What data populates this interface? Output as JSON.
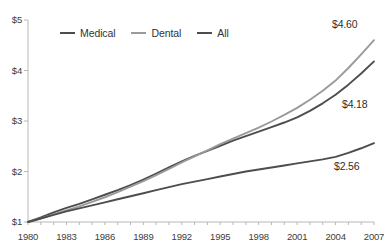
{
  "chart_data": {
    "type": "line",
    "title": "",
    "xlabel": "",
    "ylabel": "",
    "xlim": [
      1980,
      2007
    ],
    "ylim": [
      1,
      5
    ],
    "grid": false,
    "legend_position": "top-left-inside",
    "x_ticks": [
      "1980",
      "1983",
      "1986",
      "1989",
      "1992",
      "1995",
      "1998",
      "2001",
      "2004",
      "2007"
    ],
    "y_ticks": [
      "$1",
      "$2",
      "$3",
      "$4",
      "$5"
    ],
    "x": [
      1980,
      1981,
      1982,
      1983,
      1984,
      1985,
      1986,
      1987,
      1988,
      1989,
      1990,
      1991,
      1992,
      1993,
      1994,
      1995,
      1996,
      1997,
      1998,
      1999,
      2000,
      2001,
      2002,
      2003,
      2004,
      2005,
      2006,
      2007
    ],
    "series": [
      {
        "name": "Medical",
        "color": "#4d4d4d",
        "end_label": "$4.18",
        "values": [
          1.0,
          1.09,
          1.19,
          1.28,
          1.36,
          1.45,
          1.54,
          1.63,
          1.73,
          1.84,
          1.96,
          2.08,
          2.2,
          2.31,
          2.41,
          2.51,
          2.61,
          2.7,
          2.79,
          2.88,
          2.97,
          3.07,
          3.2,
          3.35,
          3.52,
          3.72,
          3.94,
          4.18
        ]
      },
      {
        "name": "Dental",
        "color": "#9a9a9a",
        "end_label": "$4.60",
        "values": [
          1.0,
          1.07,
          1.15,
          1.23,
          1.31,
          1.4,
          1.49,
          1.59,
          1.7,
          1.81,
          1.93,
          2.05,
          2.18,
          2.3,
          2.42,
          2.54,
          2.65,
          2.76,
          2.87,
          2.99,
          3.12,
          3.26,
          3.42,
          3.6,
          3.8,
          4.05,
          4.32,
          4.6
        ]
      },
      {
        "name": "All",
        "color": "#4d4d4d",
        "end_label": "$2.56",
        "values": [
          1.0,
          1.07,
          1.14,
          1.21,
          1.27,
          1.33,
          1.39,
          1.45,
          1.51,
          1.57,
          1.63,
          1.69,
          1.75,
          1.8,
          1.85,
          1.9,
          1.95,
          2.0,
          2.04,
          2.08,
          2.12,
          2.16,
          2.2,
          2.24,
          2.29,
          2.37,
          2.46,
          2.56
        ]
      }
    ],
    "annotations": [
      {
        "text": "$4.60",
        "series": "Dental"
      },
      {
        "text": "$4.18",
        "series": "Medical"
      },
      {
        "text": "$2.56",
        "series": "All"
      }
    ]
  },
  "axis": {
    "y_labels": [
      "$5",
      "$4",
      "$3",
      "$2",
      "$1"
    ],
    "x_labels": [
      "1980",
      "1983",
      "1986",
      "1989",
      "1992",
      "1995",
      "1998",
      "2001",
      "2004",
      "2007"
    ]
  },
  "legend": {
    "items": [
      {
        "label": "Medical",
        "color": "#4d4d4d"
      },
      {
        "label": "Dental",
        "color": "#9a9a9a"
      },
      {
        "label": "All",
        "color": "#4d4d4d"
      }
    ]
  },
  "labels": {
    "top": "$4.60",
    "middle": "$4.18",
    "bottom": "$2.56"
  }
}
